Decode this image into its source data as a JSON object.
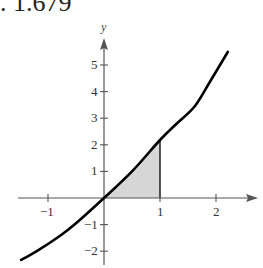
{
  "caption": {
    "text": ". 1.679"
  },
  "chart_data": {
    "type": "line",
    "title": "",
    "xlabel": "x",
    "ylabel": "y",
    "xlim": [
      -1.5,
      2.6
    ],
    "ylim": [
      -2.4,
      5.9
    ],
    "grid": false,
    "x_ticks": [
      -1,
      1,
      2
    ],
    "x_tick_labels": [
      "−1",
      "1",
      "2"
    ],
    "y_ticks": [
      -2,
      -1,
      1,
      2,
      3,
      4,
      5
    ],
    "y_tick_labels": [
      "−2",
      "−1",
      "1",
      "2",
      "3",
      "4",
      "5"
    ],
    "series": [
      {
        "name": "curve",
        "x": [
          -1.48,
          -1.2,
          -0.79,
          -0.5,
          0,
          0.5,
          1.0,
          1.3,
          1.625,
          1.9,
          2.21
        ],
        "y": [
          -2.33,
          -2.0,
          -1.43,
          -0.95,
          0,
          1.0,
          2.18,
          2.8,
          3.46,
          4.4,
          5.49
        ]
      }
    ],
    "shaded_region": {
      "description": "Area under the curve between x = 0 and x = 1",
      "x_from": 0,
      "x_to": 1,
      "fill": "#d6d6d6"
    },
    "colors": {
      "curve": "#000000",
      "axes": "#555555",
      "fill": "#d6d6d6"
    }
  }
}
